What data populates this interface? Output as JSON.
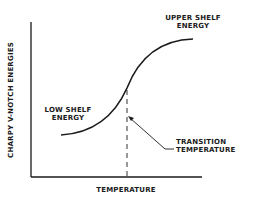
{
  "diagram": {
    "type": "ductile-brittle transition curve",
    "y_axis_label": "CHARPY V-NOTCH ENERGIES",
    "x_axis_label": "TEMPERATURE",
    "annotations": {
      "upper_shelf": [
        "UPPER SHELF",
        "ENERGY"
      ],
      "low_shelf": [
        "LOW SHELF",
        "ENERGY"
      ],
      "transition": [
        "TRANSITION",
        "TEMPERATURE"
      ]
    },
    "colors": {
      "ink": "#1a1a1a",
      "background": "#ffffff"
    }
  }
}
